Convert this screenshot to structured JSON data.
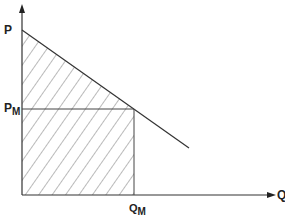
{
  "diagram": {
    "type": "demand-curve-surplus",
    "y_axis_label": "P",
    "x_axis_label": "Q",
    "price_label": {
      "main": "P",
      "sub": "M"
    },
    "quantity_label": {
      "main": "Q",
      "sub": "M"
    },
    "colors": {
      "line": "#333333",
      "hatch": "#555555",
      "background": "#ffffff"
    },
    "geometry": {
      "origin": [
        22,
        195
      ],
      "y_axis_top": 5,
      "x_axis_right": 275,
      "demand_start": [
        22,
        30
      ],
      "demand_end": [
        189,
        148
      ],
      "pm_y": 109,
      "qm_x": 134
    }
  }
}
